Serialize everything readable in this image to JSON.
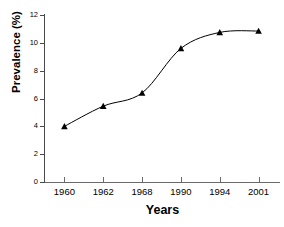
{
  "chart_data": {
    "type": "line",
    "title": "",
    "xlabel": "Years",
    "ylabel": "Prevalence (%)",
    "categories": [
      "1960",
      "1962",
      "1968",
      "1990",
      "1994",
      "2001"
    ],
    "values": [
      4.0,
      5.45,
      6.4,
      9.6,
      10.75,
      10.85
    ],
    "series": [
      {
        "name": "Prevalence",
        "values": [
          4.0,
          5.45,
          6.4,
          9.6,
          10.75,
          10.85
        ],
        "marker": "triangle",
        "color": "#000000"
      }
    ],
    "ylim": [
      0,
      12
    ],
    "yticks": [
      0,
      2,
      4,
      6,
      8,
      10,
      12
    ],
    "ytick_labels": [
      "0",
      "2",
      "4",
      "6",
      "8",
      "10",
      "12"
    ],
    "xtick_labels": [
      "1960",
      "1962",
      "1968",
      "1990",
      "1994",
      "2001"
    ],
    "grid": false,
    "legend": false,
    "legend_position": "none",
    "line_color": "#000000",
    "marker_color": "#000000",
    "axis_color": "#4a4a4a",
    "background": "#ffffff"
  },
  "axes": {
    "x_title": "Years",
    "y_title": "Prevalence (%)"
  }
}
